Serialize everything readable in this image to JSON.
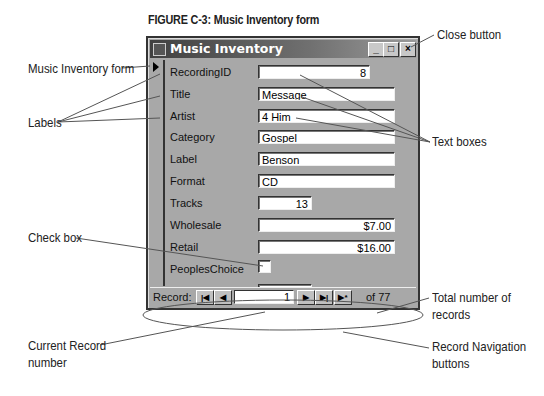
{
  "figure": {
    "caption_prefix": "FIGURE C-3:",
    "caption_title": "Music Inventory form"
  },
  "window": {
    "title": "Music Inventory",
    "controls": {
      "minimize": "_",
      "maximize": "□",
      "close": "×"
    }
  },
  "form": {
    "fields": [
      {
        "label": "RecordingID",
        "value": "8",
        "type": "text",
        "align": "right"
      },
      {
        "label": "Title",
        "value": "Message",
        "type": "text",
        "align": "left"
      },
      {
        "label": "Artist",
        "value": "4 Him",
        "type": "text",
        "align": "left"
      },
      {
        "label": "Category",
        "value": "Gospel",
        "type": "text",
        "align": "left"
      },
      {
        "label": "Label",
        "value": "Benson",
        "type": "text",
        "align": "left"
      },
      {
        "label": "Format",
        "value": "CD",
        "type": "text",
        "align": "left"
      },
      {
        "label": "Tracks",
        "value": "13",
        "type": "text",
        "align": "right"
      },
      {
        "label": "Wholesale",
        "value": "$7.00",
        "type": "text",
        "align": "right"
      },
      {
        "label": "Retail",
        "value": "$16.00",
        "type": "text",
        "align": "right"
      },
      {
        "label": "PeoplesChoice",
        "value": "",
        "type": "checkbox",
        "checked": false
      },
      {
        "label": "Quantity",
        "value": "25",
        "type": "text",
        "align": "right"
      }
    ]
  },
  "navigation": {
    "label": "Record:",
    "first": "|◀",
    "prev": "◀",
    "current": "1",
    "next": "▶",
    "last": "▶|",
    "new": "▶*",
    "of_text": "of",
    "total": "77"
  },
  "callouts": {
    "close_button": "Close button",
    "form": "Music Inventory form",
    "labels": "Labels",
    "text_boxes": "Text boxes",
    "check_box": "Check box",
    "total_records_line1": "Total number of",
    "total_records_line2": "records",
    "current_record_line1": "Current Record",
    "current_record_line2": "number",
    "nav_buttons_line1": "Record Navigation",
    "nav_buttons_line2": "buttons"
  }
}
